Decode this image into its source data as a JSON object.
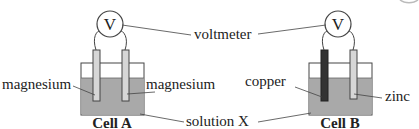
{
  "diagram": {
    "labels": {
      "voltmeter": "voltmeter",
      "solution": "solution X",
      "voltmeter_symbol": "V"
    },
    "cell_a": {
      "title": "Cell A",
      "left_electrode": "magnesium",
      "right_electrode": "magnesium"
    },
    "cell_b": {
      "title": "Cell B",
      "left_electrode": "copper",
      "right_electrode": "zinc"
    },
    "colors": {
      "solution": "#a9a9a9",
      "electrode_light": "#d6d6d6",
      "electrode_dark": "#333333",
      "outline": "#444444"
    }
  }
}
